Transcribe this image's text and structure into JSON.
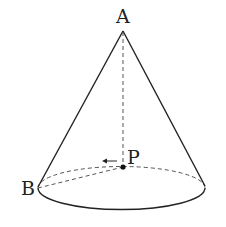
{
  "diagram": {
    "type": "cone",
    "labels": {
      "apex": "A",
      "base_point": "B",
      "center": "P"
    },
    "colors": {
      "stroke": "#222222",
      "dashed": "#555555",
      "background": "#ffffff"
    }
  }
}
